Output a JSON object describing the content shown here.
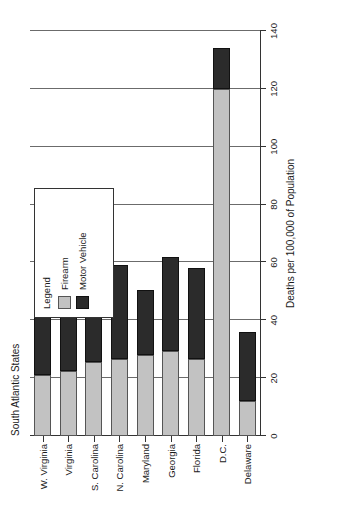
{
  "chart_data": {
    "type": "bar",
    "orientation": "horizontal-stacked",
    "title": "South Atlantic States",
    "xlabel": "Deaths per 100,000 of Population",
    "ylabel": "",
    "xlim": [
      0,
      140
    ],
    "grid": true,
    "legend_position": "upper-right-inset",
    "categories": [
      "W. Virginia",
      "Virginia",
      "S. Carolina",
      "N. Carolina",
      "Maryland",
      "Georgia",
      "Florida",
      "D.C.",
      "Delaware"
    ],
    "xticks": [
      0,
      20,
      40,
      60,
      80,
      100,
      120,
      140
    ],
    "xtick_labels": [
      "0",
      "20",
      "40",
      "60",
      "80",
      "100",
      "120",
      "140"
    ],
    "series": [
      {
        "name": "Firearm",
        "color": "#c2c2c2",
        "values": [
          21,
          22.5,
          25.5,
          26.5,
          28,
          29.5,
          26.5,
          120,
          12
        ]
      },
      {
        "name": "Motor Vehicle",
        "color": "#2b2b2b",
        "values": [
          46,
          24.5,
          42,
          32.5,
          22.5,
          32.5,
          31.5,
          14,
          24
        ]
      }
    ],
    "totals": [
      67,
      47,
      67.5,
      59,
      50.5,
      62,
      58,
      134,
      36
    ]
  },
  "legend": {
    "title": "Legend",
    "items": [
      {
        "label": "Firearm",
        "swatch": "firearm"
      },
      {
        "label": "Motor Vehicle",
        "swatch": "motor"
      }
    ]
  }
}
